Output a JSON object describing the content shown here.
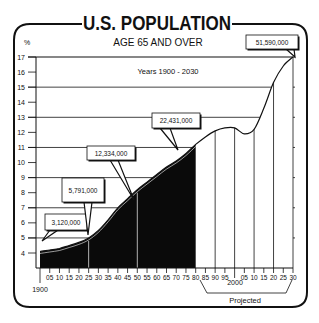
{
  "chart_data": {
    "type": "area",
    "title": "U.S. POPULATION",
    "subtitle": "AGE 65 AND OVER",
    "annotation_range": "Years 1900 - 2030",
    "xlabel": "",
    "ylabel": "%",
    "xlim": [
      1900,
      2030
    ],
    "ylim": [
      4,
      17
    ],
    "grid": true,
    "y_ticks": [
      "4",
      "5",
      "6",
      "7",
      "8",
      "9",
      "10",
      "11",
      "12",
      "13",
      "14",
      "15",
      "16",
      "17"
    ],
    "x_tick_labels": [
      "05",
      "10",
      "15",
      "20",
      "25",
      "30",
      "35",
      "40",
      "45",
      "50",
      "55",
      "60",
      "65",
      "70",
      "75",
      "80",
      "85",
      "90",
      "95",
      "05",
      "10",
      "15",
      "20",
      "25",
      "30"
    ],
    "x_tick_years": [
      1905,
      1910,
      1915,
      1920,
      1925,
      1930,
      1935,
      1940,
      1945,
      1950,
      1955,
      1960,
      1965,
      1970,
      1975,
      1980,
      1985,
      1990,
      1995,
      2005,
      2010,
      2015,
      2020,
      2025,
      2030
    ],
    "x_start_label": "1900",
    "x_mid_label": "2000",
    "projected_label": "Projected",
    "x": [
      1900,
      1905,
      1910,
      1915,
      1920,
      1925,
      1930,
      1935,
      1940,
      1945,
      1950,
      1955,
      1960,
      1965,
      1970,
      1975,
      1980,
      1985,
      1990,
      1995,
      2000,
      2005,
      2010,
      2015,
      2020,
      2025,
      2030
    ],
    "series": [
      {
        "name": "Percent of population age 65 and over",
        "values": [
          4.1,
          4.2,
          4.3,
          4.5,
          4.7,
          5.0,
          5.5,
          6.2,
          7.0,
          7.6,
          8.2,
          8.7,
          9.2,
          9.7,
          10.1,
          10.6,
          11.2,
          11.7,
          12.1,
          12.3,
          12.3,
          11.9,
          12.2,
          13.6,
          15.3,
          16.4,
          17.0
        ]
      }
    ],
    "actual_until": 1980,
    "projected_from": 1980,
    "callouts": [
      {
        "year": 1900,
        "label": "3,120,000"
      },
      {
        "year": 1925,
        "label": "5,791,000"
      },
      {
        "year": 1950,
        "label": "12,334,000"
      },
      {
        "year": 1975,
        "label": "22,431,000"
      },
      {
        "year": 2030,
        "label": "51,590,000"
      }
    ]
  }
}
